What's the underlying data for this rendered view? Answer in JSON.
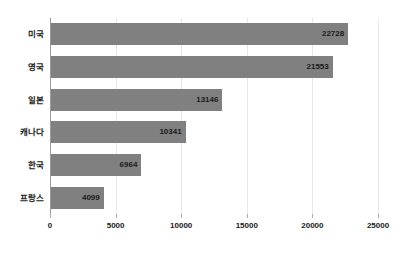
{
  "chart_data": {
    "type": "bar",
    "orientation": "horizontal",
    "title": "",
    "subtitle": "",
    "xlabel": "",
    "ylabel": "",
    "categories": [
      "미국",
      "영국",
      "일본",
      "캐나다",
      "한국",
      "프랑스"
    ],
    "values": [
      22728,
      21553,
      13146,
      10341,
      6964,
      4099
    ],
    "value_labels": [
      "22728",
      "21553",
      "13146",
      "10341",
      "6964",
      "4099"
    ],
    "xlim": [
      0,
      25000
    ],
    "xticks": [
      0,
      5000,
      10000,
      15000,
      20000,
      25000
    ],
    "xtick_labels": [
      "0",
      "5000",
      "10000",
      "15000",
      "20000",
      "25000"
    ],
    "grid": "vertical",
    "legend": "none",
    "series": [
      {
        "name": "",
        "values": [
          22728,
          21553,
          13146,
          10341,
          6964,
          4099
        ]
      }
    ],
    "colors": {
      "bar": "#808080",
      "gridline": "#e8e8e8",
      "axis": "#9a9a9a",
      "text": "#1a1a1a",
      "background": "#ffffff"
    }
  }
}
